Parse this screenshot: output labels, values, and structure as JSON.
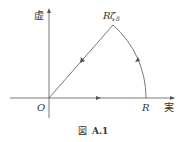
{
  "figure": {
    "caption_prefix": "図",
    "caption_number": "A.1",
    "imag_axis_label": "虚",
    "real_axis_label": "実",
    "origin_label": "O",
    "r_label": "R",
    "apex_label_main": "R",
    "apex_label_zeta": "ζ",
    "apex_label_sub": "8",
    "stroke_color": "#555555"
  }
}
